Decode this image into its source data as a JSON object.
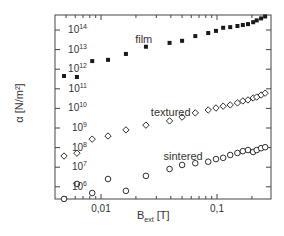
{
  "chart_data": {
    "type": "scatter",
    "title": "",
    "xlabel": "B_ext [T]",
    "xlabel_main": "B",
    "xlabel_sub": "ext",
    "xlabel_unit": " [T]",
    "ylabel": "α [N/m²]",
    "xscale": "log",
    "yscale": "log",
    "xlim": [
      0.0042,
      0.29
    ],
    "ylim": [
      250000,
      250000000000000
    ],
    "grid": false,
    "legend": "none (inline annotations)",
    "x_ticks": [
      {
        "value": 0.01,
        "label": "0,01"
      },
      {
        "value": 0.1,
        "label": "0,1"
      }
    ],
    "y_ticks": [
      {
        "exp": 6,
        "label": "10",
        "sup": "6"
      },
      {
        "exp": 7,
        "label": "10",
        "sup": "7"
      },
      {
        "exp": 8,
        "label": "10",
        "sup": "8"
      },
      {
        "exp": 9,
        "label": "10",
        "sup": "9"
      },
      {
        "exp": 10,
        "label": "10",
        "sup": "10"
      },
      {
        "exp": 11,
        "label": "10",
        "sup": "11"
      },
      {
        "exp": 12,
        "label": "10",
        "sup": "12"
      },
      {
        "exp": 13,
        "label": "10",
        "sup": "13"
      },
      {
        "exp": 14,
        "label": "10",
        "sup": "14"
      }
    ],
    "x": [
      0.0048,
      0.0062,
      0.0084,
      0.0115,
      0.0164,
      0.0244,
      0.039,
      0.05,
      0.065,
      0.084,
      0.098,
      0.113,
      0.13,
      0.15,
      0.167,
      0.185,
      0.205,
      0.22,
      0.24,
      0.26
    ],
    "series": [
      {
        "name": "film",
        "marker": "filled-square",
        "values": [
          450000000000.0,
          400000000000.0,
          2600000000000.0,
          3000000000000.0,
          6000000000000.0,
          14000000000000.0,
          22000000000000.0,
          28000000000000.0,
          49000000000000.0,
          70000000000000.0,
          90000000000000.0,
          130000000000000.0,
          140000000000000.0,
          160000000000000.0,
          180000000000000.0,
          200000000000000.0,
          250000000000000.0,
          310000000000000.0,
          390000000000000.0,
          490000000000000.0
        ],
        "annotation": {
          "text": "film",
          "x": 0.0205,
          "y": 30000000000000.0
        }
      },
      {
        "name": "textured",
        "marker": "open-diamond",
        "values": [
          37000000.0,
          52000000.0,
          270000000.0,
          390000000.0,
          800000000.0,
          1400000000.0,
          2300000000.0,
          3600000000.0,
          5900000000.0,
          8300000000.0,
          10500000000.0,
          13000000000.0,
          15000000000.0,
          19000000000.0,
          24000000000.0,
          27000000000.0,
          34000000000.0,
          38000000000.0,
          48000000000.0,
          60000000000.0
        ],
        "annotation": {
          "text": "textured",
          "x": 0.028,
          "y": 6000000000.0
        }
      },
      {
        "name": "sintered",
        "marker": "open-circle",
        "values": [
          240000.0,
          1400000.0,
          480000.0,
          2500000.0,
          620000.0,
          3600000.0,
          8100000.0,
          13000000.0,
          16000000.0,
          19000000.0,
          26000000.0,
          30000000.0,
          42000000.0,
          53000000.0,
          66000000.0,
          75000000.0,
          60000000.0,
          75000000.0,
          93000000.0,
          105000000.0
        ],
        "annotation": {
          "text": "sintered",
          "x": 0.036,
          "y": 32000000.0
        }
      }
    ]
  },
  "colors": {
    "axis": "#444444",
    "marker": "#1a1a1a",
    "text": "#333333",
    "background": "#ffffff"
  }
}
